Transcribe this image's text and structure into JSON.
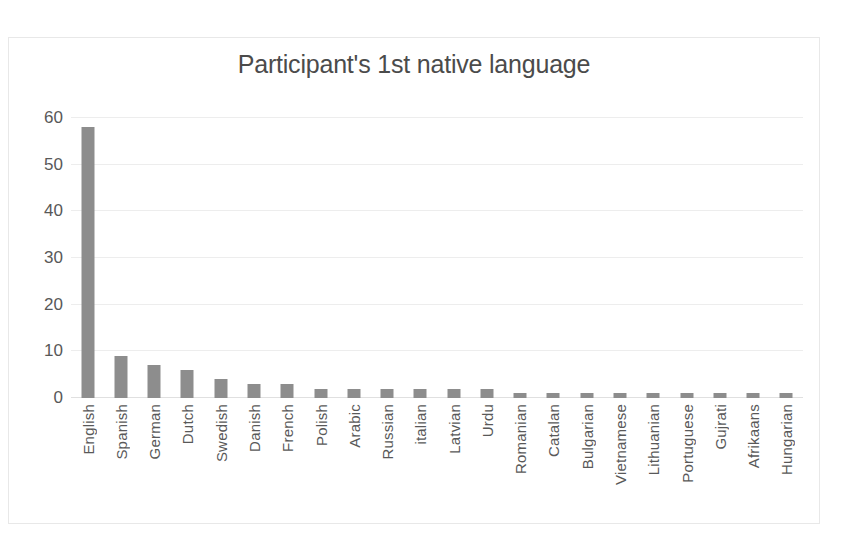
{
  "chart_data": {
    "type": "bar",
    "title": "Participant's 1st native language",
    "xlabel": "",
    "ylabel": "",
    "ylim": [
      0,
      60
    ],
    "yticks": [
      0,
      10,
      20,
      30,
      40,
      50,
      60
    ],
    "grid": true,
    "legend": false,
    "orientation": "vertical",
    "bar_color": "#8d8d8d",
    "categories": [
      "English",
      "Spanish",
      "German",
      "Dutch",
      "Swedish",
      "Danish",
      "French",
      "Polish",
      "Arabic",
      "Russian",
      "italian",
      "Latvian",
      "Urdu",
      "Romanian",
      "Catalan",
      "Bulgarian",
      "Vietnamese",
      "Lithuanian",
      "Portuguese",
      "Gujrati",
      "Afrikaans",
      "Hungarian"
    ],
    "values": [
      58,
      9,
      7,
      6,
      4,
      3,
      3,
      2,
      2,
      2,
      2,
      2,
      2,
      1,
      1,
      1,
      1,
      1,
      1,
      1,
      1,
      1
    ]
  }
}
